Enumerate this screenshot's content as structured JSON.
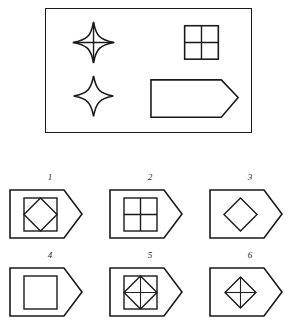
{
  "puzzle": {
    "type": "visual-analogy-shape-matrix",
    "stimulus": {
      "panel_shape": "rectangle",
      "elements": [
        {
          "name": "four-pointed-star-with-cross",
          "position": "top-left",
          "description": "Concave four-pointed star with a vertical and horizontal line through its centre"
        },
        {
          "name": "four-pointed-star-plain",
          "position": "bottom-left",
          "description": "Concave four-pointed star, empty inside"
        },
        {
          "name": "square-quartered",
          "position": "top-right",
          "description": "Square divided into four quadrants by a vertical and a horizontal line"
        },
        {
          "name": "pentagon-arrow-plain",
          "position": "bottom-right",
          "description": "Home-plate pentagon pointing right, empty inside"
        }
      ]
    },
    "options": [
      {
        "label": "1",
        "name": "option-1",
        "contents": "pentagon with square containing inscribed diamond"
      },
      {
        "label": "2",
        "name": "option-2",
        "contents": "pentagon with square divided into four quadrants"
      },
      {
        "label": "3",
        "name": "option-3",
        "contents": "pentagon with plain diamond"
      },
      {
        "label": "4",
        "name": "option-4",
        "contents": "pentagon with plain square"
      },
      {
        "label": "5",
        "name": "option-5",
        "contents": "pentagon with square, inscribed diamond and cross lines"
      },
      {
        "label": "6",
        "name": "option-6",
        "contents": "pentagon with diamond and cross lines"
      }
    ]
  },
  "colors": {
    "ink": "#1a1a1a",
    "background": "#ffffff"
  }
}
